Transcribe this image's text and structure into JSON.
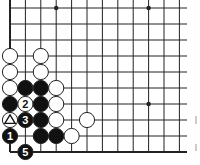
{
  "diagram": {
    "type": "go-board-fragment",
    "grid": {
      "origin_x": 10,
      "origin_y": 8,
      "spacing_x": 15.4,
      "spacing_y": 16,
      "cols": 12,
      "rows": 10,
      "line_extend_right": 187,
      "bottom_edge_y": 152,
      "left_edge_x": 10
    },
    "star_points": [
      {
        "col": 3,
        "row": 0
      },
      {
        "col": 9,
        "row": 0
      },
      {
        "col": 9,
        "row": 6
      }
    ],
    "stones": [
      {
        "color": "white",
        "col": 0,
        "row": 3,
        "label": ""
      },
      {
        "color": "white",
        "col": 2,
        "row": 3,
        "label": ""
      },
      {
        "color": "white",
        "col": 0,
        "row": 4,
        "label": ""
      },
      {
        "color": "white",
        "col": 2,
        "row": 4,
        "label": ""
      },
      {
        "color": "white",
        "col": 0,
        "row": 5,
        "label": ""
      },
      {
        "color": "black",
        "col": 1,
        "row": 5,
        "label": ""
      },
      {
        "color": "black",
        "col": 2,
        "row": 5,
        "label": ""
      },
      {
        "color": "white",
        "col": 3,
        "row": 5,
        "label": ""
      },
      {
        "color": "black",
        "col": 0,
        "row": 6,
        "label": ""
      },
      {
        "color": "white",
        "col": 1,
        "row": 6,
        "label": "2"
      },
      {
        "color": "black",
        "col": 2,
        "row": 6,
        "label": ""
      },
      {
        "color": "white",
        "col": 3,
        "row": 6,
        "label": ""
      },
      {
        "color": "white",
        "col": 0,
        "row": 7,
        "label": "triangle"
      },
      {
        "color": "black",
        "col": 1,
        "row": 7,
        "label": "3"
      },
      {
        "color": "black",
        "col": 2,
        "row": 7,
        "label": ""
      },
      {
        "color": "white",
        "col": 3,
        "row": 7,
        "label": ""
      },
      {
        "color": "white",
        "col": 5,
        "row": 7,
        "label": ""
      },
      {
        "color": "black",
        "col": 0,
        "row": 8,
        "label": "1"
      },
      {
        "color": "black",
        "col": 2,
        "row": 8,
        "label": ""
      },
      {
        "color": "black",
        "col": 3,
        "row": 8,
        "label": ""
      },
      {
        "color": "white",
        "col": 4,
        "row": 8,
        "label": ""
      },
      {
        "color": "black",
        "col": 1,
        "row": 9,
        "label": "5"
      }
    ],
    "labels": {
      "move_1": "1",
      "move_2": "2",
      "move_3": "3",
      "move_5": "5",
      "marker": "triangle"
    },
    "colors": {
      "line": "#222222",
      "black_stone": "#111111",
      "white_stone": "#ffffff",
      "stone_outline": "#222222"
    }
  }
}
